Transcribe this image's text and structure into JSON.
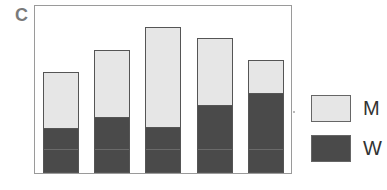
{
  "chart_data": {
    "type": "bar",
    "stacked": true,
    "panel_label": "C",
    "title": "",
    "xlabel": "",
    "ylabel": "",
    "categories": [
      "1",
      "2",
      "3",
      "4",
      "5"
    ],
    "series": [
      {
        "name": "W",
        "color": "#4a4a4a",
        "values": [
          45,
          56,
          46,
          68,
          80
        ]
      },
      {
        "name": "M",
        "color": "#e6e6e6",
        "values": [
          56,
          67,
          100,
          67,
          33
        ]
      }
    ],
    "ylim": [
      0,
      167
    ],
    "grid": false,
    "axes_ticks": false,
    "legend": {
      "position": "right",
      "entries": [
        "M",
        "W"
      ]
    }
  },
  "legend": {
    "m_label": "M",
    "w_label": "W"
  },
  "panel_label": "C"
}
